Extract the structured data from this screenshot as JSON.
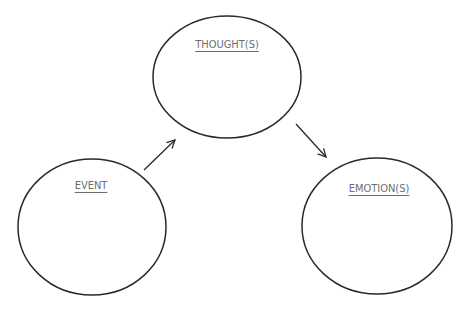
{
  "diagram": {
    "type": "cognitive-triangle",
    "nodes": [
      {
        "id": "event",
        "label": "EVENT"
      },
      {
        "id": "thoughts",
        "label": "THOUGHT(S)"
      },
      {
        "id": "emotions",
        "label": "EMOTION(S)"
      }
    ],
    "edges": [
      {
        "from": "event",
        "to": "thoughts"
      },
      {
        "from": "thoughts",
        "to": "emotions"
      }
    ],
    "colors": {
      "stroke": "#2a2a2a",
      "label": "#6e6e6e",
      "background": "#ffffff"
    }
  }
}
